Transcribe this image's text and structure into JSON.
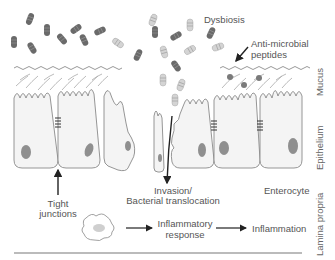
{
  "diagram": {
    "type": "gut epithelial barrier schematic",
    "labels": {
      "dysbiosis": "Dysbiosis",
      "amp_line1": "Anti-microbial",
      "amp_line2": "peptides",
      "tight_line1": "Tight",
      "tight_line2": "junctions",
      "invasion_line1": "Invasion/",
      "invasion_line2": "Bacterial translocation",
      "enterocyte": "Enterocyte",
      "inflam_resp_line1": "Inflammatory",
      "inflam_resp_line2": "response",
      "inflammation": "Inflammation"
    },
    "layers": {
      "mucus": "Mucus",
      "epithelium": "Epithelium",
      "lamina_propria": "Lamina propria"
    },
    "colors": {
      "outline": "#8a8a8a",
      "cell_fill": "#f4f4f4",
      "nucleus": "#8f8f8f",
      "bacteria_dark": "#6a6a6a",
      "bacteria_light": "#c8c8c8",
      "arrow": "#222222",
      "text": "#555555"
    }
  }
}
